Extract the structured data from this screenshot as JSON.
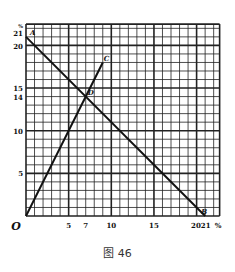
{
  "chart_data": {
    "type": "line",
    "title": "",
    "caption": "图 46",
    "xlabel": "%",
    "ylabel": "%",
    "origin_label": "O",
    "xlim": [
      0,
      22.7
    ],
    "ylim": [
      0,
      22.5
    ],
    "grid": true,
    "x_ticks": [
      5,
      7,
      10,
      15,
      20,
      21
    ],
    "y_ticks": [
      5,
      10,
      14,
      15,
      20,
      21
    ],
    "series": [
      {
        "name": "AB",
        "points": [
          {
            "x": 0,
            "y": 21,
            "label": "A"
          },
          {
            "x": 21,
            "y": 0,
            "label": "B"
          }
        ]
      },
      {
        "name": "OC",
        "points": [
          {
            "x": 0,
            "y": 0,
            "label": "O"
          },
          {
            "x": 9,
            "y": 18,
            "label": "C"
          }
        ]
      }
    ],
    "annotations": [
      {
        "label": "A",
        "x": 0,
        "y": 21
      },
      {
        "label": "B",
        "x": 21,
        "y": 0
      },
      {
        "label": "C",
        "x": 9,
        "y": 18
      },
      {
        "label": "D",
        "x": 7,
        "y": 14
      }
    ]
  },
  "caption": "图 46"
}
